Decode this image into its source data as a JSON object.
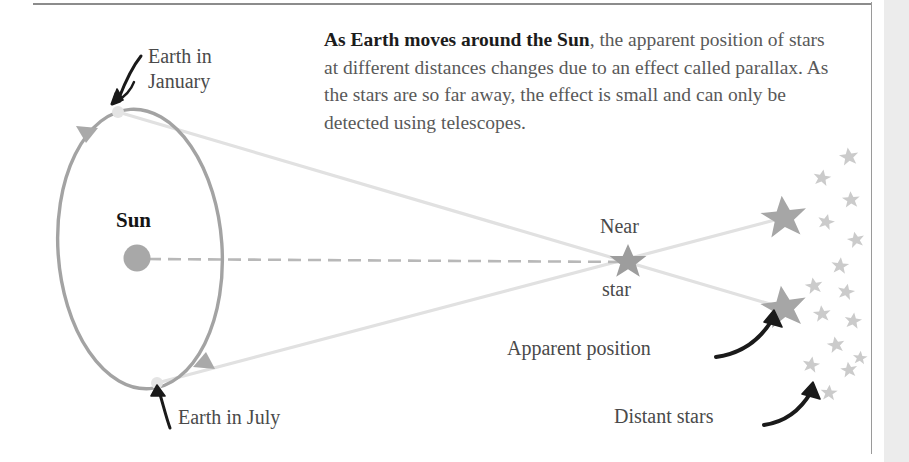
{
  "figure": {
    "caption_paragraph": {
      "bold_lead": "As Earth moves around the Sun",
      "rest": ", the apparent position of stars at different distances changes due to an effect called parallax. As the stars are so far away, the effect is small and can only be detected using telescopes."
    },
    "labels": {
      "earth_january_line1": "Earth in",
      "earth_january_line2": "January",
      "earth_july": "Earth in July",
      "sun": "Sun",
      "near_star_line1": "Near",
      "near_star_line2": "star",
      "apparent_position": "Apparent position",
      "distant_stars": "Distant stars"
    },
    "colors": {
      "orbit": "#a0a0a0",
      "sun_body": "#a8a8a8",
      "near_star": "#9d9d9d",
      "apparent_star": "#a6a6a6",
      "distant_star": "#c9c9c9",
      "sight_line": "#e0e0e0",
      "sight_axis_dash": "#b5b5b5",
      "earth_marker": "#e2e2e2",
      "arrow_black": "#1a1a1a",
      "body_text": "#595959",
      "bold_text": "#1c1c1c",
      "rule": "#8c8c8c",
      "side_band": "#ececec"
    },
    "diagram": {
      "type": "stellar-parallax-schematic",
      "sun": {
        "cx": 137,
        "cy": 258,
        "r": 13
      },
      "orbit_ellipse": {
        "cx": 140,
        "cy": 249,
        "rx": 82,
        "ry": 140,
        "rotation_deg": -4
      },
      "earth_january": {
        "cx": 118,
        "cy": 112,
        "r": 5.5
      },
      "earth_july": {
        "cx": 157,
        "cy": 383,
        "r": 5.5
      },
      "near_star": {
        "cx": 628,
        "cy": 262,
        "r": 17
      },
      "apparent_star_upper": {
        "cx": 784,
        "cy": 218,
        "r": 20
      },
      "apparent_star_lower": {
        "cx": 784,
        "cy": 308,
        "r": 20
      },
      "sight_line_january": {
        "from": [
          118,
          112
        ],
        "to": [
          784,
          308
        ]
      },
      "sight_line_july": {
        "from": [
          157,
          383
        ],
        "to": [
          784,
          218
        ]
      },
      "sun_axis_dashed": {
        "from": [
          150,
          259
        ],
        "to": [
          628,
          262
        ]
      },
      "distant_stars": [
        {
          "cx": 849,
          "cy": 157,
          "r": 9
        },
        {
          "cx": 822,
          "cy": 178,
          "r": 8
        },
        {
          "cx": 849,
          "cy": 199,
          "r": 8
        },
        {
          "cx": 826,
          "cy": 221,
          "r": 8
        },
        {
          "cx": 855,
          "cy": 239,
          "r": 8
        },
        {
          "cx": 840,
          "cy": 266,
          "r": 8
        },
        {
          "cx": 813,
          "cy": 285,
          "r": 8
        },
        {
          "cx": 845,
          "cy": 292,
          "r": 8
        },
        {
          "cx": 822,
          "cy": 313,
          "r": 8
        },
        {
          "cx": 852,
          "cy": 320,
          "r": 8
        },
        {
          "cx": 835,
          "cy": 344,
          "r": 8
        },
        {
          "cx": 811,
          "cy": 364,
          "r": 8
        },
        {
          "cx": 848,
          "cy": 369,
          "r": 8
        },
        {
          "cx": 828,
          "cy": 392,
          "r": 8
        },
        {
          "cx": 858,
          "cy": 358,
          "r": 7
        }
      ],
      "orbit_direction_arrows": 2,
      "callout_arrows": [
        {
          "name": "earth-january-arrow",
          "direction": "down-left"
        },
        {
          "name": "earth-july-arrow",
          "direction": "up-left"
        },
        {
          "name": "apparent-position-arrow",
          "direction": "up-right"
        },
        {
          "name": "distant-stars-arrow",
          "direction": "up-right"
        }
      ]
    }
  }
}
